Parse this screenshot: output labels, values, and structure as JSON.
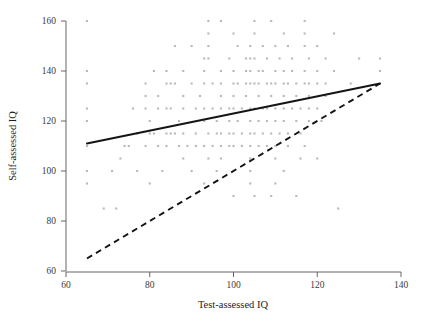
{
  "chart_data": {
    "type": "scatter",
    "title": "",
    "xlabel": "Test-assessed IQ",
    "ylabel": "Self-assessed IQ",
    "xlim": [
      60,
      140
    ],
    "ylim": [
      60,
      160
    ],
    "xticks": [
      60,
      80,
      100,
      120,
      140
    ],
    "yticks": [
      60,
      80,
      100,
      120,
      140,
      160
    ],
    "xtick_labels": [
      "60",
      "80",
      "100",
      "120",
      "140"
    ],
    "ytick_labels": [
      "60",
      "80",
      "100",
      "120",
      "140",
      "160"
    ],
    "grid": false,
    "legend": null,
    "point_color": "#b9b9bd",
    "point_marker": "square",
    "point_size": 2.1,
    "points": [
      [
        65,
        160
      ],
      [
        94,
        160
      ],
      [
        97,
        160
      ],
      [
        105,
        160
      ],
      [
        109,
        160
      ],
      [
        117,
        160
      ],
      [
        94,
        155
      ],
      [
        100,
        155
      ],
      [
        105,
        155
      ],
      [
        112,
        155
      ],
      [
        117,
        155
      ],
      [
        124,
        155
      ],
      [
        86,
        150
      ],
      [
        90,
        150
      ],
      [
        94,
        150
      ],
      [
        101,
        150
      ],
      [
        104,
        150
      ],
      [
        107,
        150
      ],
      [
        110,
        150
      ],
      [
        113,
        150
      ],
      [
        117,
        150
      ],
      [
        120,
        150
      ],
      [
        93,
        145
      ],
      [
        94,
        145
      ],
      [
        99,
        145
      ],
      [
        103,
        145
      ],
      [
        104,
        145
      ],
      [
        105,
        145
      ],
      [
        108,
        145
      ],
      [
        111,
        145
      ],
      [
        114,
        145
      ],
      [
        118,
        145
      ],
      [
        122,
        145
      ],
      [
        130,
        145
      ],
      [
        135,
        145
      ],
      [
        65,
        140
      ],
      [
        81,
        140
      ],
      [
        84,
        140
      ],
      [
        88,
        140
      ],
      [
        93,
        140
      ],
      [
        97,
        140
      ],
      [
        100,
        140
      ],
      [
        103,
        140
      ],
      [
        104,
        140
      ],
      [
        106,
        140
      ],
      [
        107,
        140
      ],
      [
        110,
        140
      ],
      [
        112,
        140
      ],
      [
        114,
        140
      ],
      [
        117,
        140
      ],
      [
        120,
        140
      ],
      [
        124,
        140
      ],
      [
        135,
        140
      ],
      [
        65,
        135
      ],
      [
        79,
        135
      ],
      [
        84,
        135
      ],
      [
        85,
        135
      ],
      [
        86,
        135
      ],
      [
        90,
        135
      ],
      [
        93,
        135
      ],
      [
        95,
        135
      ],
      [
        97,
        135
      ],
      [
        100,
        135
      ],
      [
        101,
        135
      ],
      [
        103,
        135
      ],
      [
        104,
        135
      ],
      [
        105,
        135
      ],
      [
        106,
        135
      ],
      [
        108,
        135
      ],
      [
        109,
        135
      ],
      [
        110,
        135
      ],
      [
        112,
        135
      ],
      [
        113,
        135
      ],
      [
        115,
        135
      ],
      [
        117,
        135
      ],
      [
        118,
        135
      ],
      [
        120,
        135
      ],
      [
        122,
        135
      ],
      [
        128,
        135
      ],
      [
        79,
        130
      ],
      [
        82,
        130
      ],
      [
        88,
        130
      ],
      [
        92,
        130
      ],
      [
        97,
        130
      ],
      [
        100,
        130
      ],
      [
        103,
        130
      ],
      [
        106,
        130
      ],
      [
        109,
        130
      ],
      [
        112,
        130
      ],
      [
        115,
        130
      ],
      [
        118,
        130
      ],
      [
        122,
        130
      ],
      [
        65,
        125
      ],
      [
        76,
        125
      ],
      [
        79,
        125
      ],
      [
        82,
        125
      ],
      [
        84,
        125
      ],
      [
        85,
        125
      ],
      [
        88,
        125
      ],
      [
        91,
        125
      ],
      [
        93,
        125
      ],
      [
        95,
        125
      ],
      [
        97,
        125
      ],
      [
        99,
        125
      ],
      [
        100,
        125
      ],
      [
        102,
        125
      ],
      [
        104,
        125
      ],
      [
        105,
        125
      ],
      [
        107,
        125
      ],
      [
        108,
        125
      ],
      [
        110,
        125
      ],
      [
        112,
        125
      ],
      [
        114,
        125
      ],
      [
        116,
        125
      ],
      [
        118,
        125
      ],
      [
        120,
        125
      ],
      [
        65,
        120
      ],
      [
        80,
        120
      ],
      [
        87,
        120
      ],
      [
        93,
        120
      ],
      [
        96,
        120
      ],
      [
        99,
        120
      ],
      [
        101,
        120
      ],
      [
        104,
        120
      ],
      [
        106,
        120
      ],
      [
        108,
        120
      ],
      [
        110,
        120
      ],
      [
        112,
        120
      ],
      [
        115,
        120
      ],
      [
        118,
        120
      ],
      [
        121,
        120
      ],
      [
        77,
        115
      ],
      [
        80,
        115
      ],
      [
        81,
        115
      ],
      [
        84,
        115
      ],
      [
        85,
        115
      ],
      [
        86,
        115
      ],
      [
        88,
        115
      ],
      [
        91,
        115
      ],
      [
        94,
        115
      ],
      [
        96,
        115
      ],
      [
        97,
        115
      ],
      [
        99,
        115
      ],
      [
        100,
        115
      ],
      [
        102,
        115
      ],
      [
        104,
        115
      ],
      [
        105,
        115
      ],
      [
        107,
        115
      ],
      [
        109,
        115
      ],
      [
        111,
        115
      ],
      [
        113,
        115
      ],
      [
        116,
        115
      ],
      [
        65,
        110
      ],
      [
        74,
        110
      ],
      [
        75,
        110
      ],
      [
        79,
        110
      ],
      [
        82,
        110
      ],
      [
        84,
        110
      ],
      [
        87,
        110
      ],
      [
        89,
        110
      ],
      [
        91,
        110
      ],
      [
        93,
        110
      ],
      [
        95,
        110
      ],
      [
        97,
        110
      ],
      [
        99,
        110
      ],
      [
        100,
        110
      ],
      [
        102,
        110
      ],
      [
        104,
        110
      ],
      [
        106,
        110
      ],
      [
        108,
        110
      ],
      [
        110,
        110
      ],
      [
        113,
        110
      ],
      [
        117,
        110
      ],
      [
        73,
        105
      ],
      [
        88,
        105
      ],
      [
        94,
        105
      ],
      [
        97,
        105
      ],
      [
        104,
        105
      ],
      [
        110,
        105
      ],
      [
        116,
        105
      ],
      [
        120,
        105
      ],
      [
        65,
        100
      ],
      [
        71,
        100
      ],
      [
        77,
        100
      ],
      [
        83,
        100
      ],
      [
        90,
        100
      ],
      [
        96,
        100
      ],
      [
        104,
        100
      ],
      [
        112,
        100
      ],
      [
        65,
        95
      ],
      [
        80,
        95
      ],
      [
        93,
        95
      ],
      [
        104,
        95
      ],
      [
        110,
        95
      ],
      [
        100,
        90
      ],
      [
        105,
        90
      ],
      [
        109,
        90
      ],
      [
        115,
        90
      ],
      [
        69,
        85
      ],
      [
        72,
        85
      ],
      [
        125,
        85
      ]
    ],
    "lines": [
      {
        "name": "regression-line",
        "style": "solid",
        "x": [
          65,
          135
        ],
        "y": [
          111,
          135
        ],
        "color": "#141414"
      },
      {
        "name": "reference-line",
        "style": "dashed",
        "x": [
          65,
          135
        ],
        "y": [
          65,
          135
        ],
        "color": "#141414"
      }
    ]
  }
}
